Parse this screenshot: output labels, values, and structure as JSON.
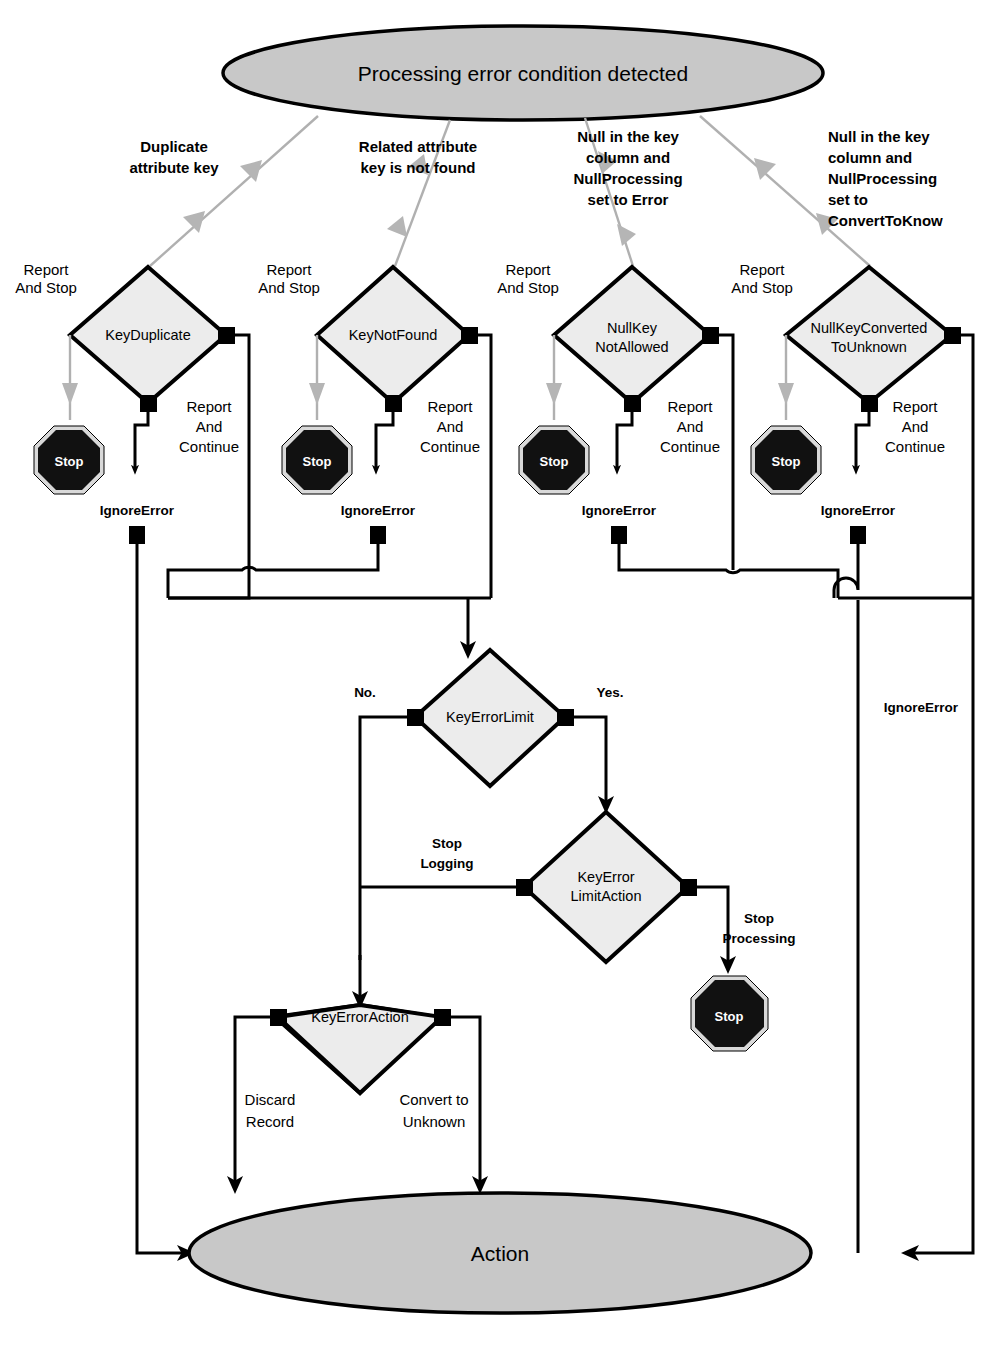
{
  "diagram": {
    "title_node": "Processing error condition detected",
    "end_node": "Action",
    "stop_label": "Stop",
    "branches": [
      {
        "trigger": "Duplicate\nattribute key",
        "trigger_line1": "Duplicate",
        "trigger_line2": "attribute key",
        "decision": "KeyDuplicate",
        "decision_line1": "KeyDuplicate",
        "decision_line2": "",
        "left_label_line1": "Report",
        "left_label_line2": "And Stop",
        "right_label_line1": "Report",
        "right_label_line2": "And",
        "right_label_line3": "Continue",
        "ignore_label": "IgnoreError"
      },
      {
        "trigger_line1": "Related attribute",
        "trigger_line2": "key is not found",
        "decision": "KeyNotFound",
        "decision_line1": "KeyNotFound",
        "decision_line2": "",
        "left_label_line1": "Report",
        "left_label_line2": "And Stop",
        "right_label_line1": "Report",
        "right_label_line2": "And",
        "right_label_line3": "Continue",
        "ignore_label": "IgnoreError"
      },
      {
        "trigger_line1": "Null in the key",
        "trigger_line2": "column and",
        "trigger_line3": "NullProcessing",
        "trigger_line4": "set to Error",
        "decision": "NullKeyNotAllowed",
        "decision_line1": "NullKey",
        "decision_line2": "NotAllowed",
        "left_label_line1": "Report",
        "left_label_line2": "And Stop",
        "right_label_line1": "Report",
        "right_label_line2": "And",
        "right_label_line3": "Continue",
        "ignore_label": "IgnoreError"
      },
      {
        "trigger_line1": "Null in the key",
        "trigger_line2": "column and",
        "trigger_line3": "NullProcessing",
        "trigger_line4": "set to",
        "trigger_line5": "ConvertToKnow",
        "decision": "NullKeyConvertedToUnknown",
        "decision_line1": "NullKeyConverted",
        "decision_line2": "ToUnknown",
        "left_label_line1": "Report",
        "left_label_line2": "And Stop",
        "right_label_line1": "Report",
        "right_label_line2": "And",
        "right_label_line3": "Continue",
        "ignore_label": "IgnoreError"
      }
    ],
    "key_error_limit": {
      "name": "KeyErrorLimit",
      "no_label": "No.",
      "yes_label": "Yes."
    },
    "key_error_limit_action": {
      "name_line1": "KeyError",
      "name_line2": "LimitAction",
      "left_label_line1": "Stop",
      "left_label_line2": "Logging",
      "right_label_line1": "Stop",
      "right_label_line2": "Processing"
    },
    "key_error_action": {
      "name": "KeyErrorAction",
      "left_label_line1": "Discard",
      "left_label_line2": "Record",
      "right_label_line1": "Convert to",
      "right_label_line2": "Unknown"
    },
    "right_ignore_error_label": "IgnoreError",
    "colors": {
      "terminator_fill": "#c8c8c8",
      "decision_fill": "#ececec",
      "connector": "#000000",
      "trigger_arrow": "#b0b0b0",
      "stop_sign": "#111111"
    }
  }
}
